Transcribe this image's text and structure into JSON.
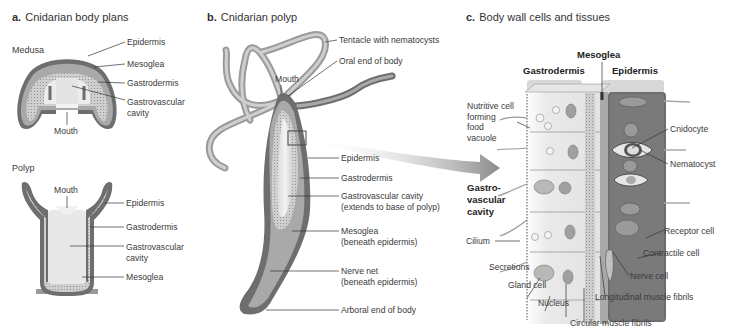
{
  "panels": {
    "a": {
      "letter": "a.",
      "title": "Cnidarian body plans",
      "medusa": {
        "heading": "Medusa",
        "labels": {
          "epidermis": "Epidermis",
          "mesoglea": "Mesoglea",
          "gastrodermis": "Gastrodermis",
          "gastrovascular_1": "Gastrovascular",
          "gastrovascular_2": "cavity",
          "mouth": "Mouth"
        }
      },
      "polyp": {
        "heading": "Polyp",
        "labels": {
          "mouth": "Mouth",
          "epidermis": "Epidermis",
          "gastrodermis": "Gastrodermis",
          "gastrovascular_1": "Gastrovascular",
          "gastrovascular_2": "cavity",
          "mesoglea": "Mesoglea"
        }
      }
    },
    "b": {
      "letter": "b.",
      "title": "Cnidarian polyp",
      "labels": {
        "tentacle": "Tentacle with nematocysts",
        "oral_end": "Oral end of body",
        "mouth": "Mouth",
        "epidermis": "Epidermis",
        "gastrodermis": "Gastrodermis",
        "gv_cavity_1": "Gastrovascular cavity",
        "gv_cavity_2": "(extends to base of polyp)",
        "mesoglea_1": "Mesoglea",
        "mesoglea_2": "(beneath epidermis)",
        "nerve_net_1": "Nerve net",
        "nerve_net_2": "(beneath epidermis)",
        "arboral_end": "Arboral end of body"
      }
    },
    "c": {
      "letter": "c.",
      "title": "Body wall cells and tissues",
      "groups": {
        "mesoglea": "Mesoglea",
        "gastrodermis": "Gastrodermis",
        "epidermis": "Epidermis"
      },
      "labels": {
        "nutritive_1": "Nutritive cell",
        "nutritive_2": "forming",
        "nutritive_3": "food",
        "nutritive_4": "vacuole",
        "gv_cavity_1": "Gastro-",
        "gv_cavity_2": "vascular",
        "gv_cavity_3": "cavity",
        "cilium": "Cilium",
        "secretions": "Secretions",
        "gland_cell": "Gland cell",
        "nucleus": "Nucleus",
        "circular_muscle": "Circular muscle fibrils",
        "longitudinal_muscle": "Longitudinal muscle fibrils",
        "nerve_cell": "Nerve cell",
        "contractile_cell": "Contractile cell",
        "receptor_cell": "Receptor cell",
        "nematocyst": "Nematocyst",
        "cnidocyte": "Cnidocyte"
      }
    }
  },
  "colors": {
    "epidermis": "#6e6e6e",
    "mesoglea": "#a9a9a9",
    "gastrodermis": "#cfcfcf",
    "cavity": "#ececec",
    "leader": "#333333"
  }
}
